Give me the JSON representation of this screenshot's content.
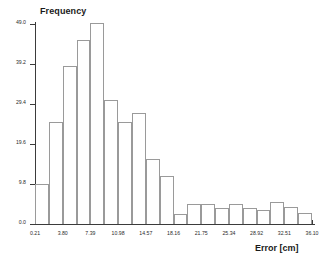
{
  "chart_data": {
    "type": "bar",
    "title": "",
    "xlabel": "Error [cm]",
    "ylabel": "Frequency",
    "xlim": [
      0.21,
      36.1
    ],
    "ylim": [
      0.0,
      49.0
    ],
    "grid": false,
    "legend": "none",
    "bin_width": 1.795,
    "x_tick_labels": [
      "0.21",
      "3.80",
      "7.39",
      "10.98",
      "14.57",
      "18.16",
      "21.75",
      "25.34",
      "28.92",
      "32.51",
      "36.10"
    ],
    "x_tick_values": [
      0.21,
      3.8,
      7.39,
      10.98,
      14.57,
      18.16,
      21.75,
      25.34,
      28.92,
      32.51,
      36.1
    ],
    "y_tick_labels": [
      "0.0",
      "9.8",
      "19.6",
      "29.4",
      "39.2",
      "49.0"
    ],
    "y_tick_values": [
      0.0,
      9.8,
      19.6,
      29.4,
      39.2,
      49.0
    ],
    "categories": [
      "0.21",
      "2.01",
      "3.80",
      "5.60",
      "7.39",
      "9.19",
      "10.98",
      "12.78",
      "14.57",
      "16.37",
      "18.16",
      "19.96",
      "21.75",
      "23.55",
      "25.34",
      "27.13",
      "28.92",
      "30.72",
      "32.51",
      "34.31"
    ],
    "bin_starts": [
      0.21,
      2.01,
      3.8,
      5.6,
      7.39,
      9.19,
      10.98,
      12.78,
      14.57,
      16.37,
      18.16,
      19.96,
      21.75,
      23.55,
      25.34,
      27.13,
      28.92,
      30.72,
      32.51,
      34.31
    ],
    "values": [
      9.8,
      25.0,
      38.8,
      45.0,
      49.2,
      30.5,
      25.0,
      27.2,
      16.0,
      11.8,
      2.5,
      5.0,
      5.0,
      4.0,
      5.0,
      4.0,
      3.5,
      5.5,
      4.2,
      2.8
    ]
  }
}
